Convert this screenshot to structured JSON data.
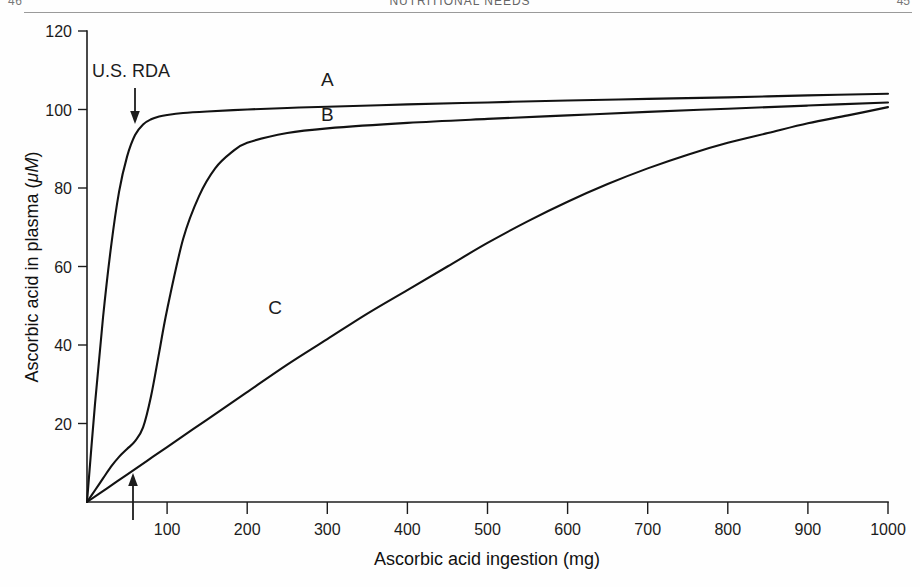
{
  "running_head": {
    "left": "46",
    "center": "NUTRITIONAL NEEDS",
    "right": "45"
  },
  "figure": {
    "curve_label_a": "A",
    "curve_label_b": "B",
    "curve_label_c": "C",
    "rda_label": "U.S. RDA",
    "rda_arrow_icon": "down-arrow-icon",
    "rda_axis_arrow_icon": "up-arrow-icon"
  },
  "chart_data": {
    "type": "line",
    "title": "",
    "xlabel": "Ascorbic acid ingestion (mg)",
    "ylabel": "Ascorbic acid in plasma (μM)",
    "ylabel_plain": "Ascorbic acid in plasma",
    "ylabel_unit": "μM",
    "xlim": [
      0,
      1000
    ],
    "ylim": [
      0,
      120
    ],
    "xticks": [
      100,
      200,
      300,
      400,
      500,
      600,
      700,
      800,
      900,
      1000
    ],
    "yticks": [
      20,
      40,
      60,
      80,
      100,
      120
    ],
    "grid": false,
    "legend": "inline-curve-labels",
    "annotations": [
      {
        "text": "U.S. RDA",
        "x": 60,
        "y": 115,
        "arrow": "down",
        "arrow_to_y": 97
      },
      {
        "text": "",
        "x": 60,
        "y": 0,
        "arrow": "up",
        "arrow_from_y": -6,
        "arrow_to_y": 9
      }
    ],
    "series": [
      {
        "name": "A",
        "label_x": 300,
        "label_y": 106,
        "x": [
          0,
          10,
          20,
          30,
          40,
          50,
          60,
          70,
          80,
          90,
          100,
          120,
          150,
          200,
          250,
          300,
          400,
          500,
          600,
          700,
          800,
          900,
          1000
        ],
        "y": [
          0,
          25,
          47,
          65,
          79,
          88,
          93.5,
          96.2,
          97.5,
          98.2,
          98.6,
          99.1,
          99.5,
          100.0,
          100.4,
          100.7,
          101.3,
          101.8,
          102.3,
          102.7,
          103.1,
          103.6,
          104.0
        ]
      },
      {
        "name": "B",
        "label_x": 300,
        "label_y": 97,
        "x": [
          0,
          10,
          20,
          30,
          40,
          50,
          60,
          70,
          80,
          90,
          100,
          120,
          140,
          160,
          180,
          200,
          250,
          300,
          400,
          500,
          600,
          700,
          800,
          900,
          1000
        ],
        "y": [
          0,
          3.0,
          6.0,
          9.0,
          11.5,
          13.5,
          15.5,
          19.0,
          27.0,
          38.0,
          49.0,
          67.0,
          78.0,
          85.0,
          89.0,
          91.5,
          94.0,
          95.2,
          96.6,
          97.6,
          98.5,
          99.4,
          100.2,
          101.0,
          101.8
        ]
      },
      {
        "name": "C",
        "label_x": 235,
        "label_y": 48,
        "x": [
          0,
          25,
          50,
          75,
          100,
          150,
          200,
          250,
          300,
          350,
          400,
          450,
          500,
          550,
          600,
          650,
          700,
          750,
          800,
          850,
          900,
          950,
          1000
        ],
        "y": [
          0,
          3.5,
          7.0,
          10.5,
          14.0,
          21.0,
          28.0,
          35.0,
          41.5,
          48.0,
          54.0,
          60.0,
          66.0,
          71.5,
          76.5,
          81.0,
          85.0,
          88.5,
          91.5,
          94.0,
          96.5,
          98.5,
          100.6
        ]
      }
    ]
  }
}
